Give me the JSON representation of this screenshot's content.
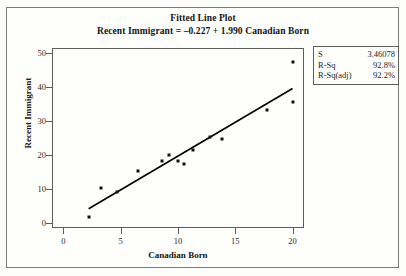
{
  "chart_data": {
    "type": "scatter",
    "title": "Fitted Line Plot",
    "subtitle": "Recent Immigrant =  –0.227 + 1.990 Canadian Born",
    "xlabel": "Canadian Born",
    "ylabel": "Recent Immigrant",
    "xlim": [
      -1.0,
      21.0
    ],
    "ylim": [
      -1.5,
      51.5
    ],
    "xticks": [
      0,
      5,
      10,
      15,
      20
    ],
    "yticks": [
      0,
      10,
      20,
      30,
      40,
      50
    ],
    "grid": false,
    "legend": false,
    "points": [
      {
        "x": 2.2,
        "y": 1.7
      },
      {
        "x": 3.3,
        "y": 10.3
      },
      {
        "x": 4.7,
        "y": 9.2
      },
      {
        "x": 6.5,
        "y": 15.3
      },
      {
        "x": 8.6,
        "y": 18.3
      },
      {
        "x": 9.2,
        "y": 20.0
      },
      {
        "x": 10.0,
        "y": 18.3
      },
      {
        "x": 10.5,
        "y": 17.2
      },
      {
        "x": 11.3,
        "y": 21.4
      },
      {
        "x": 12.8,
        "y": 25.3
      },
      {
        "x": 13.8,
        "y": 24.7
      },
      {
        "x": 17.8,
        "y": 33.3
      },
      {
        "x": 20.0,
        "y": 47.5
      },
      {
        "x": 20.0,
        "y": 35.6
      }
    ],
    "fit_line": {
      "intercept": -0.227,
      "slope": 1.99,
      "x_start": 2.2,
      "x_end": 20.0,
      "equation": "Recent Immigrant =  –0.227 + 1.990 Canadian Born"
    },
    "stats": [
      {
        "key": "S",
        "value": "3.46078"
      },
      {
        "key": "R-Sq",
        "value": "92.8%"
      },
      {
        "key": "R-Sq(adj)",
        "value": "92.2%"
      }
    ]
  },
  "colors": {
    "point": "#111111",
    "line": "#000000",
    "frame": "#5d5d5b",
    "outer_border": "#7b7b78",
    "background": "#fefefd"
  }
}
